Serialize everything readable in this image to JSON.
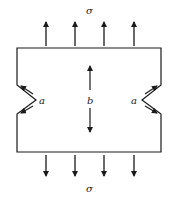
{
  "diagram": {
    "labels": {
      "stress_top": "σ",
      "stress_bottom": "σ",
      "notch_left": "a",
      "notch_right": "a",
      "width": "b"
    },
    "colors": {
      "stroke": "#1a1a1a",
      "background": "#ffffff"
    },
    "top_arrow_count": 4,
    "bottom_arrow_count": 4
  }
}
